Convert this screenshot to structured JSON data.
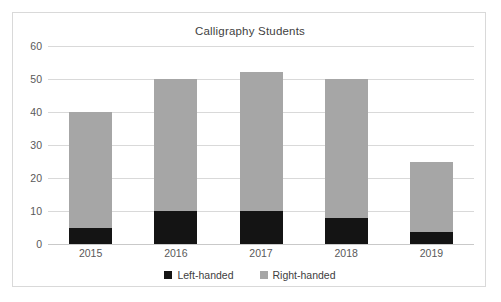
{
  "chart_data": {
    "type": "bar",
    "subtype": "stacked-column",
    "title": "Calligraphy Students",
    "xlabel": "",
    "ylabel": "",
    "categories": [
      "2015",
      "2016",
      "2017",
      "2018",
      "2019"
    ],
    "series": [
      {
        "name": "Left-handed",
        "color": "#141414",
        "values": [
          5,
          10,
          10,
          8,
          3.5
        ]
      },
      {
        "name": "Right-handed",
        "color": "#a6a6a6",
        "values": [
          35,
          40,
          42,
          42,
          21.5
        ]
      }
    ],
    "totals": [
      40,
      50,
      52,
      50,
      25
    ],
    "ylim": [
      0,
      60
    ],
    "yticks": [
      0,
      10,
      20,
      30,
      40,
      50,
      60
    ],
    "ytick_labels": [
      "0",
      "10",
      "20",
      "30",
      "40",
      "50",
      "60"
    ],
    "grid": true,
    "grid_axis": "y",
    "legend": true,
    "legend_position": "bottom",
    "legend_entries": [
      "Left-handed",
      "Right-handed"
    ],
    "plot_background": "#ffffff",
    "gridline_color": "#d9d9d9",
    "border_color": "#d9d9d9"
  }
}
